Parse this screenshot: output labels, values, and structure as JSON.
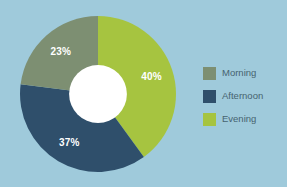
{
  "background_color": "#9fcadb",
  "chart_data": {
    "type": "pie",
    "variant": "donut",
    "title": "",
    "subtitle": "",
    "xlabel": "",
    "ylabel": "",
    "grid": false,
    "start_angle_deg": 0,
    "direction": "clockwise",
    "hole_ratio": 0.37,
    "hole_color": "#ffffff",
    "label_color": "#ffffff",
    "legend_position": "right",
    "categories": [
      "Morning",
      "Afternoon",
      "Evening"
    ],
    "values": [
      23,
      37,
      40
    ],
    "unit": "%",
    "colors": [
      "#7d8f72",
      "#2f4f6b",
      "#a6c440"
    ],
    "slices": [
      {
        "label": "Morning",
        "value": 23,
        "display": "23%",
        "color": "#7d8f72"
      },
      {
        "label": "Afternoon",
        "value": 37,
        "display": "37%",
        "color": "#2f4f6b"
      },
      {
        "label": "Evening",
        "value": 40,
        "display": "40%",
        "color": "#a6c440"
      }
    ]
  },
  "legend": {
    "items": [
      {
        "label": "Morning",
        "color": "#7d8f72"
      },
      {
        "label": "Afternoon",
        "color": "#2f4f6b"
      },
      {
        "label": "Evening",
        "color": "#a6c440"
      }
    ]
  }
}
